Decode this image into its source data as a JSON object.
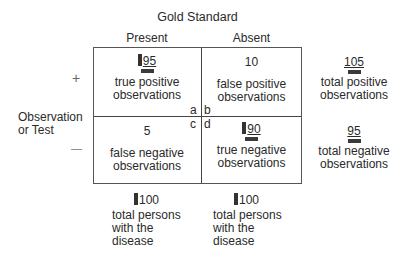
{
  "title": "Gold Standard",
  "columns": [
    {
      "label": "Present"
    },
    {
      "label": "Absent"
    }
  ],
  "rows": [
    {
      "sign": "+"
    },
    {
      "sign": "—"
    }
  ],
  "row_axis_label_line1": "Observation",
  "row_axis_label_line2": "or Test",
  "cells": {
    "a": {
      "letter": "a",
      "value": "95",
      "line1": "true positive",
      "line2": "observations",
      "marked": true
    },
    "b": {
      "letter": "b",
      "value": "10",
      "line1": "false positive",
      "line2": "observations",
      "marked": false
    },
    "c": {
      "letter": "c",
      "value": "5",
      "line1": "false negative",
      "line2": "observations",
      "marked": false
    },
    "d": {
      "letter": "d",
      "value": "90",
      "line1": "true negative",
      "line2": "observations",
      "marked": true
    }
  },
  "row_totals": [
    {
      "value": "105",
      "line1": "total positive",
      "line2": "observations"
    },
    {
      "value": "95",
      "line1": "total negative",
      "line2": "observations"
    }
  ],
  "column_totals": [
    {
      "value": "100",
      "line1": "total persons",
      "line2": "with the",
      "line3": "disease"
    },
    {
      "value": "100",
      "line1": "total persons",
      "line2": "with the",
      "line3": "disease"
    }
  ],
  "colors": {
    "text": "#2a2a2a",
    "border": "#555555",
    "marker": "#333333"
  }
}
